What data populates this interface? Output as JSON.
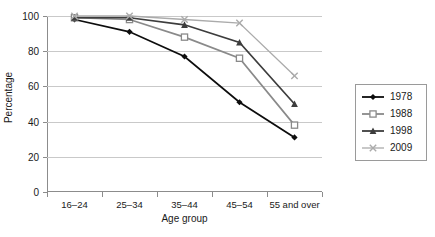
{
  "chart_data": {
    "type": "line",
    "title": "",
    "xlabel": "Age group",
    "ylabel": "Percentage",
    "categories": [
      "16–24",
      "25–34",
      "35–44",
      "45–54",
      "55 and over"
    ],
    "ylim": [
      0,
      100
    ],
    "yticks": [
      0,
      20,
      40,
      60,
      80,
      100
    ],
    "ytick_labels": [
      "0",
      "20",
      "40",
      "60",
      "80",
      "100"
    ],
    "grid": "horizontal",
    "legend_position": "right",
    "series": [
      {
        "name": "1978",
        "values": [
          98,
          91,
          77,
          51,
          31
        ],
        "color": "#0d0d0d",
        "marker": "diamond"
      },
      {
        "name": "1988",
        "values": [
          99,
          98,
          88,
          76,
          38
        ],
        "color": "#8a8a8a",
        "marker": "square-open"
      },
      {
        "name": "1998",
        "values": [
          99,
          99,
          95,
          85,
          50
        ],
        "color": "#3d3d3d",
        "marker": "triangle"
      },
      {
        "name": "2009",
        "values": [
          100,
          100,
          98,
          96,
          66
        ],
        "color": "#ababab",
        "marker": "cross"
      }
    ]
  },
  "legend": {
    "items": [
      {
        "label": "1978"
      },
      {
        "label": "1988"
      },
      {
        "label": "1998"
      },
      {
        "label": "2009"
      }
    ]
  }
}
